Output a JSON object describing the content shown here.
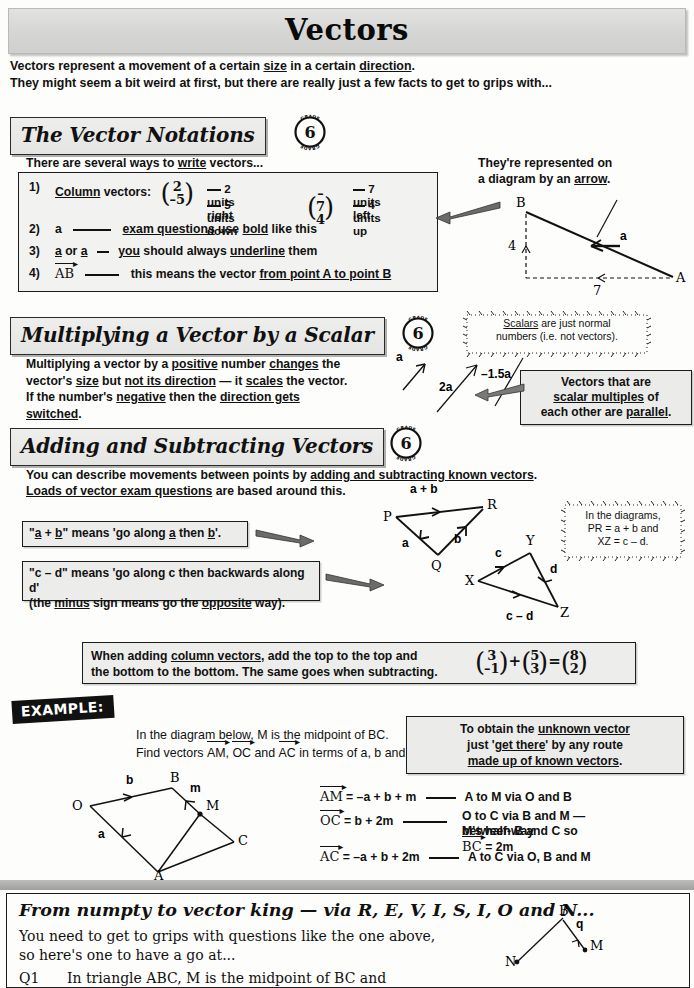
{
  "page": {
    "title": "Vectors",
    "intro_line1_a": "Vectors represent a movement of a certain ",
    "intro_line1_u1": "size",
    "intro_line1_b": " in a certain ",
    "intro_line1_u2": "direction",
    "intro_line1_c": ".",
    "intro_line2": "They might seem a bit weird at first, but there are really just a few facts to get to grips with..."
  },
  "grade_badge": {
    "number": "6",
    "ring_text": "GRADE"
  },
  "section1": {
    "heading": "The Vector Notations",
    "lead_a": "There are several ways to ",
    "lead_u": "write",
    "lead_b": " vectors...",
    "items": [
      {
        "num": "1)",
        "label_u": "Column",
        "label_rest": " vectors:",
        "vec1_top": "2",
        "vec1_bottom": "–5",
        "vec1_note_top": "2 units right",
        "vec1_note_bottom": "5 units down",
        "vec2_top": "–7",
        "vec2_bottom": "4",
        "vec2_note_top": "7 units left",
        "vec2_note_bottom": "4 units up"
      },
      {
        "num": "2)",
        "symbol": "a",
        "text_u1": "exam questions",
        "text_mid": " use ",
        "text_u2": "bold",
        "text_end": " like this"
      },
      {
        "num": "3)",
        "symbol_a": "a",
        "symbol_or": " or ",
        "symbol_b": "a",
        "text_u1": "you",
        "text_mid": " should always ",
        "text_u2": "underline",
        "text_end": " them"
      },
      {
        "num": "4)",
        "symbol": "AB",
        "text_pre": "this means the vector ",
        "text_u": "from point A to point B"
      }
    ],
    "diagram": {
      "caption_line1": "They're represented on",
      "caption_line2_a": "a diagram by an ",
      "caption_line2_u": "arrow",
      "caption_line2_b": ".",
      "point_B": "B",
      "point_A": "A",
      "vector_label": "a",
      "vertical_value": "4",
      "horizontal_value": "7"
    }
  },
  "section2": {
    "heading": "Multiplying a Vector by a Scalar",
    "para_parts": [
      "Multiplying a vector by a ",
      "positive",
      " number ",
      "changes",
      " the"
    ],
    "para_line2": [
      "vector's ",
      "size",
      " but ",
      "not its direction",
      " — it ",
      "scales",
      " the vector."
    ],
    "para_line3": [
      "If the number's ",
      "negative",
      " then the ",
      "direction gets switched",
      "."
    ],
    "scalars_bubble_u": "Scalars",
    "scalars_bubble_line1_rest": " are just normal",
    "scalars_bubble_line2": "numbers (i.e. not vectors).",
    "arrow_labels": {
      "a": "a",
      "two_a": "2a",
      "minus_one_point_five_a": "–1.5a"
    },
    "callout_line1": "Vectors that are",
    "callout_line2_u": "scalar multiples",
    "callout_line2_rest": " of",
    "callout_line3_a": "each other are ",
    "callout_line3_u": "parallel",
    "callout_line3_b": "."
  },
  "section3": {
    "heading": "Adding and Subtracting Vectors",
    "lead_line1": [
      "You can describe movements between points by ",
      "adding and subtracting known vectors",
      "."
    ],
    "lead_line2": [
      "Loads of vector exam questions",
      " are based around this."
    ],
    "callout_ab": "\"a + b\" means 'go along a then b'.",
    "callout_ab_parts": {
      "quote_open": "\"",
      "a": "a",
      "plus": " + ",
      "b": "b",
      "mid": "\" means 'go along ",
      "a2": "a",
      "then": " then ",
      "b2": "b",
      "end": "'."
    },
    "callout_cd_line1": "\"c – d\" means 'go along c then backwards along d'",
    "callout_cd_line2_a": "(the ",
    "callout_cd_line2_u1": "minus",
    "callout_cd_line2_b": " sign means go the ",
    "callout_cd_line2_u2": "opposite",
    "callout_cd_line2_c": " way).",
    "triangle1": {
      "P": "P",
      "Q": "Q",
      "R": "R",
      "top_label": "a + b",
      "left_label": "a",
      "right_label": "b"
    },
    "triangle2": {
      "X": "X",
      "Y": "Y",
      "Z": "Z",
      "left_label": "c",
      "right_label": "d",
      "bottom_label": "c – d"
    },
    "diagram_bubble_line1": "In the diagrams,",
    "diagram_bubble_line2": "PR = a + b and",
    "diagram_bubble_line3": "XZ = c – d.",
    "column_box_line1_a": "When adding ",
    "column_box_line1_u": "column vectors",
    "column_box_line1_b": ", add the top to the top and",
    "column_box_line2": "the bottom to the bottom.  The same goes when subtracting.",
    "column_sum": {
      "v1_top": "3",
      "v1_bottom": "–1",
      "op1": "+",
      "v2_top": "5",
      "v2_bottom": "3",
      "op2": "=",
      "v3_top": "8",
      "v3_bottom": "2"
    }
  },
  "example": {
    "tag": "EXAMPLE:",
    "question_line1": "In the diagram below, M is the midpoint of BC.",
    "question_line2_a": "Find vectors ",
    "question_line2_v1": "AM",
    "question_line2_sep1": ", ",
    "question_line2_v2": "OC",
    "question_line2_sep2": " and ",
    "question_line2_v3": "AC",
    "question_line2_b": " in terms of a, b and m.",
    "tip_line1_a": "To obtain the ",
    "tip_line1_u": "unknown vector",
    "tip_line2_a": "just '",
    "tip_line2_u": "get there",
    "tip_line2_b": "' by any route",
    "tip_line3_u": "made up of known vectors",
    "tip_line3_b": ".",
    "diagram": {
      "O": "O",
      "A": "A",
      "B": "B",
      "C": "C",
      "M": "M",
      "a": "a",
      "b": "b",
      "m": "m"
    },
    "answers": [
      {
        "vec": "AM",
        "eq": "= –a + b + m",
        "note": "A to M via O and B"
      },
      {
        "vec": "OC",
        "eq": "= b + 2m",
        "note_line1": "O to C via B and M — M's half-way",
        "note_line2_a": "between B and C so ",
        "note_line2_v": "BC",
        "note_line2_b": " = 2m"
      },
      {
        "vec": "AC",
        "eq": "= –a + b + 2m",
        "note": "A to C via O, B and M"
      }
    ]
  },
  "footer": {
    "heading": "From numpty to vector king — via R, E, V, I, S, I, O and N...",
    "line1": "You need to get to grips with questions like the one above,",
    "line2": "so here's one to have a go at...",
    "q_number": "Q1",
    "q_text": "In triangle ABC, M is the midpoint of BC and",
    "diagram": {
      "B": "B",
      "N": "N",
      "M": "M",
      "q": "q"
    }
  },
  "colors": {
    "banner": "#d7d7d5",
    "header_box": "#e9e9e7",
    "content_box": "#f1f1ef",
    "ink": "#111111"
  }
}
